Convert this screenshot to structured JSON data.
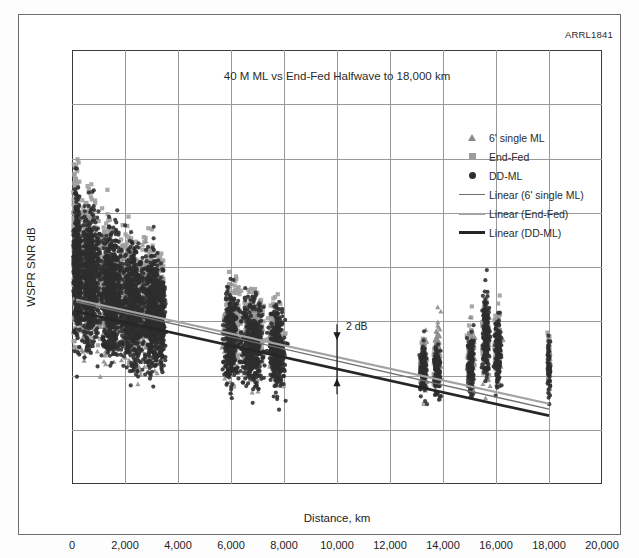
{
  "figure": {
    "id_label": "ARRL1841"
  },
  "chart_data": {
    "type": "scatter",
    "title": "40 M ML vs End-Fed Halfwave to 18,000 km",
    "xlabel": "Distance, km",
    "ylabel": "WSPR SNR dB",
    "xlim": [
      0,
      20000
    ],
    "ylim": [
      -40,
      40
    ],
    "grid": true,
    "legend_position": "inside-top-right",
    "xticks": [
      "0",
      "2,000",
      "4,000",
      "6,000",
      "8,000",
      "10,000",
      "12,000",
      "14,000",
      "16,000",
      "18,000",
      "20,000"
    ],
    "xtick_values": [
      0,
      2000,
      4000,
      6000,
      8000,
      10000,
      12000,
      14000,
      16000,
      18000,
      20000
    ],
    "yticks": [
      "40",
      "30",
      "20",
      "10",
      "0",
      "-10",
      "-20",
      "-30",
      "-40"
    ],
    "ytick_values": [
      40,
      30,
      20,
      10,
      0,
      -10,
      -20,
      -30,
      -40
    ],
    "legend": [
      {
        "label": "6' single ML",
        "marker": "triangle",
        "color": "#8c8c8c"
      },
      {
        "label": "End-Fed",
        "marker": "square",
        "color": "#9d9d9d"
      },
      {
        "label": "DD-ML",
        "marker": "circle",
        "color": "#2e2e2e"
      },
      {
        "label": "Linear (6' single ML)",
        "marker": "line",
        "color": "#6f6f6f"
      },
      {
        "label": "Linear (End-Fed)",
        "marker": "line",
        "color": "#a3a3a3"
      },
      {
        "label": "Linear (DD-ML)",
        "marker": "line",
        "color": "#262626"
      }
    ],
    "annotations": [
      {
        "text": "2 dB",
        "x": 10000,
        "y": -17,
        "type": "double-arrow",
        "span_y": [
          -20.5,
          -13.5
        ]
      }
    ],
    "trendlines": [
      {
        "name": "Linear (6' single ML)",
        "color": "#6f6f6f",
        "width": 1.4,
        "x": [
          150,
          18000
        ],
        "y": [
          -6.4,
          -26.2
        ]
      },
      {
        "name": "Linear (End-Fed)",
        "color": "#a3a3a3",
        "width": 2.2,
        "x": [
          150,
          18000
        ],
        "y": [
          -6.0,
          -25.2
        ]
      },
      {
        "name": "Linear (DD-ML)",
        "color": "#262626",
        "width": 2.6,
        "x": [
          150,
          18000
        ],
        "y": [
          -8.2,
          -27.4
        ]
      }
    ],
    "series": [
      {
        "name": "End-Fed",
        "marker": "square",
        "color": "#9d9d9d",
        "clusters": [
          {
            "x_center": 150,
            "x_spread": 150,
            "y_center": 4,
            "y_spread": 26,
            "n": 260
          },
          {
            "x_center": 600,
            "x_spread": 320,
            "y_center": 2,
            "y_spread": 22,
            "n": 300
          },
          {
            "x_center": 1300,
            "x_spread": 420,
            "y_center": -2,
            "y_spread": 20,
            "n": 300
          },
          {
            "x_center": 2100,
            "x_spread": 400,
            "y_center": -4,
            "y_spread": 19,
            "n": 280
          },
          {
            "x_center": 2900,
            "x_spread": 380,
            "y_center": -5,
            "y_spread": 18,
            "n": 260
          },
          {
            "x_center": 3350,
            "x_spread": 150,
            "y_center": -6,
            "y_spread": 16,
            "n": 110
          },
          {
            "x_center": 6100,
            "x_spread": 320,
            "y_center": -11,
            "y_spread": 15,
            "n": 190
          },
          {
            "x_center": 6900,
            "x_spread": 420,
            "y_center": -12,
            "y_spread": 14,
            "n": 200
          },
          {
            "x_center": 7700,
            "x_spread": 300,
            "y_center": -13,
            "y_spread": 13,
            "n": 150
          },
          {
            "x_center": 13250,
            "x_spread": 130,
            "y_center": -18,
            "y_spread": 9,
            "n": 70
          },
          {
            "x_center": 13750,
            "x_spread": 130,
            "y_center": -18,
            "y_spread": 9,
            "n": 70
          },
          {
            "x_center": 15050,
            "x_spread": 150,
            "y_center": -16,
            "y_spread": 11,
            "n": 80
          },
          {
            "x_center": 15600,
            "x_spread": 140,
            "y_center": -13,
            "y_spread": 13,
            "n": 90
          },
          {
            "x_center": 16050,
            "x_spread": 130,
            "y_center": -14,
            "y_spread": 12,
            "n": 85
          },
          {
            "x_center": 18000,
            "x_spread": 60,
            "y_center": -17,
            "y_spread": 10,
            "n": 45
          }
        ]
      },
      {
        "name": "6' single ML",
        "marker": "triangle",
        "color": "#8c8c8c",
        "clusters": [
          {
            "x_center": 400,
            "x_spread": 300,
            "y_center": -6,
            "y_spread": 20,
            "n": 130
          },
          {
            "x_center": 1400,
            "x_spread": 500,
            "y_center": -8,
            "y_spread": 19,
            "n": 150
          },
          {
            "x_center": 2400,
            "x_spread": 500,
            "y_center": -9,
            "y_spread": 18,
            "n": 150
          },
          {
            "x_center": 3150,
            "x_spread": 300,
            "y_center": -10,
            "y_spread": 16,
            "n": 90
          },
          {
            "x_center": 5900,
            "x_spread": 250,
            "y_center": -13,
            "y_spread": 14,
            "n": 80
          },
          {
            "x_center": 6800,
            "x_spread": 450,
            "y_center": -14,
            "y_spread": 14,
            "n": 110
          },
          {
            "x_center": 7700,
            "x_spread": 300,
            "y_center": -15,
            "y_spread": 12,
            "n": 70
          },
          {
            "x_center": 13300,
            "x_spread": 140,
            "y_center": -17,
            "y_spread": 10,
            "n": 45
          },
          {
            "x_center": 13800,
            "x_spread": 140,
            "y_center": -14,
            "y_spread": 12,
            "n": 45
          },
          {
            "x_center": 15100,
            "x_spread": 150,
            "y_center": -17,
            "y_spread": 10,
            "n": 45
          },
          {
            "x_center": 15650,
            "x_spread": 150,
            "y_center": -15,
            "y_spread": 12,
            "n": 50
          },
          {
            "x_center": 16100,
            "x_spread": 130,
            "y_center": -16,
            "y_spread": 11,
            "n": 45
          },
          {
            "x_center": 18000,
            "x_spread": 55,
            "y_center": -18,
            "y_spread": 9,
            "n": 25
          }
        ]
      },
      {
        "name": "DD-ML",
        "marker": "circle",
        "color": "#2e2e2e",
        "clusters": [
          {
            "x_center": 200,
            "x_spread": 180,
            "y_center": 0,
            "y_spread": 24,
            "n": 420
          },
          {
            "x_center": 700,
            "x_spread": 380,
            "y_center": -2,
            "y_spread": 22,
            "n": 560
          },
          {
            "x_center": 1500,
            "x_spread": 480,
            "y_center": -5,
            "y_spread": 21,
            "n": 620
          },
          {
            "x_center": 2300,
            "x_spread": 450,
            "y_center": -7,
            "y_spread": 20,
            "n": 600
          },
          {
            "x_center": 3050,
            "x_spread": 380,
            "y_center": -8,
            "y_spread": 19,
            "n": 520
          },
          {
            "x_center": 3400,
            "x_spread": 130,
            "y_center": -9,
            "y_spread": 17,
            "n": 160
          },
          {
            "x_center": 6000,
            "x_spread": 300,
            "y_center": -13,
            "y_spread": 16,
            "n": 300
          },
          {
            "x_center": 6800,
            "x_spread": 480,
            "y_center": -14,
            "y_spread": 15,
            "n": 380
          },
          {
            "x_center": 7750,
            "x_spread": 330,
            "y_center": -15,
            "y_spread": 14,
            "n": 280
          },
          {
            "x_center": 13250,
            "x_spread": 140,
            "y_center": -19,
            "y_spread": 9,
            "n": 110
          },
          {
            "x_center": 13780,
            "x_spread": 140,
            "y_center": -19,
            "y_spread": 9,
            "n": 110
          },
          {
            "x_center": 15050,
            "x_spread": 150,
            "y_center": -18,
            "y_spread": 10,
            "n": 120
          },
          {
            "x_center": 15620,
            "x_spread": 150,
            "y_center": -12,
            "y_spread": 15,
            "n": 160
          },
          {
            "x_center": 16080,
            "x_spread": 140,
            "y_center": -16,
            "y_spread": 12,
            "n": 130
          },
          {
            "x_center": 18000,
            "x_spread": 55,
            "y_center": -19,
            "y_spread": 9,
            "n": 55
          }
        ]
      }
    ]
  }
}
